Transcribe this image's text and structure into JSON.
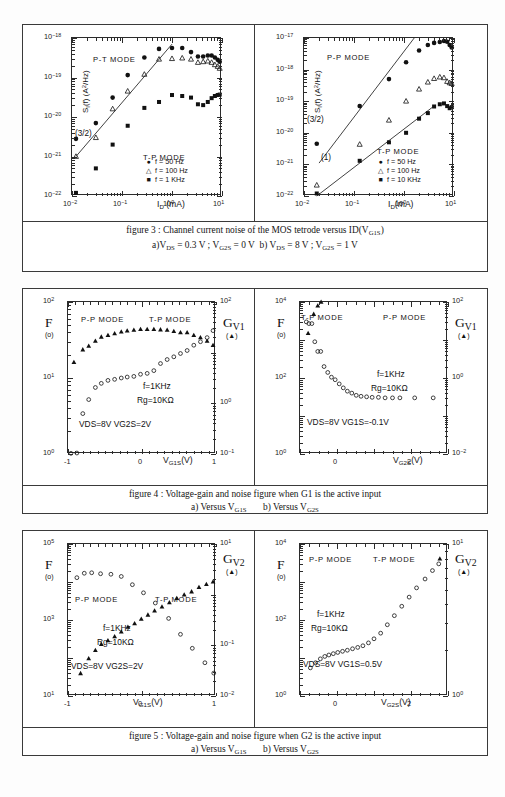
{
  "page": {
    "background": "#ffffff",
    "ink": "#1a1a1a"
  },
  "figures": [
    {
      "id": "figure-3",
      "caption_line1": "figure 3 : Channel current noise of the MOS tetrode versus ID(VG1S)",
      "caption_line2": "a)VDS = 0.3 V ; VG2S = 0 V   b) VDS = 8 V ; VG2S = 1 V",
      "caption_parts": {
        "label": "figure 3 :",
        "text": "Channel current noise of the MOS tetrode versus ID(V",
        "sub1": "G1S",
        "tail": ")",
        "a_prefix": "a)V",
        "a_sub1": "DS",
        "a_mid": " = 0.3 V ; V",
        "a_sub2": "G2S",
        "a_end": " = 0 V",
        "b_prefix": "b) V",
        "b_sub1": "DS",
        "b_mid": " = 8 V ; V",
        "b_sub2": "G2S",
        "b_end": " = 1 V"
      }
    },
    {
      "id": "figure-4",
      "caption_line1": "figure 4 : Voltage-gain and noise figure when G1 is the active input",
      "caption_line2": "a) Versus VG1S        b) Versus VG2S",
      "caption_parts": {
        "label": "figure 4 :",
        "text": "Voltage-gain and noise figure when G1 is the active input",
        "a_prefix": "a) Versus V",
        "a_sub": "G1S",
        "b_prefix": "b) Versus V",
        "b_sub": "G2S"
      }
    },
    {
      "id": "figure-5",
      "caption_line1": "figure 5 : Voltage-gain and noise figure when G2 is the active input",
      "caption_line2": "a) Versus VG1S        b) Versus VG2S",
      "caption_parts": {
        "label": "figure 5 :",
        "text": "Voltage-gain and noise figure when G2 is the active input",
        "a_prefix": "a) Versus V",
        "a_sub": "G1S",
        "b_prefix": "b) Versus V",
        "b_sub": "G2S"
      }
    }
  ],
  "chart_data": [
    {
      "id": "fig3a",
      "type": "scatter",
      "title": "",
      "xlabel": "I_D (mA)",
      "ylabel": "S_I(f)  (A^2/Hz)",
      "xscale": "log",
      "yscale": "log",
      "xlim": [
        0.01,
        10
      ],
      "ylim": [
        1e-22,
        1e-18
      ],
      "xticklabels": [
        "10-2",
        "10-1",
        "100",
        "101"
      ],
      "yticklabels": [
        "10-18",
        "10-19",
        "10-20",
        "10-21",
        "10-22"
      ],
      "mode_labels": [
        "P-T MODE",
        "T-P MODE"
      ],
      "slope_annotations": [
        "(3/2)"
      ],
      "legend_position": "lower-right",
      "series": [
        {
          "name": "f = 50 Hz",
          "marker": "filled-circle",
          "x": [
            0.012,
            0.03,
            0.065,
            0.13,
            0.28,
            0.55,
            1.0,
            1.6,
            2.4,
            3.3,
            4.2,
            5.2,
            6.2,
            7.2,
            8.2,
            9.0
          ],
          "y": [
            2.8e-21,
            7e-21,
            3.1e-20,
            1.15e-19,
            3.2e-19,
            5.3e-19,
            5.6e-19,
            5.6e-19,
            4.4e-19,
            3.4e-19,
            3.4e-19,
            3.6e-19,
            3.6e-19,
            3.2e-19,
            2.8e-19,
            2.5e-19
          ]
        },
        {
          "name": "f = 100 Hz",
          "marker": "open-triangle",
          "x": [
            0.012,
            0.03,
            0.065,
            0.13,
            0.28,
            0.55,
            1.0,
            1.6,
            2.4,
            3.3,
            4.2,
            5.2,
            6.2,
            7.2,
            8.2,
            9.0
          ],
          "y": [
            1e-21,
            3e-21,
            1.6e-20,
            4.5e-20,
            1.2e-19,
            2.9e-19,
            3e-19,
            3.1e-19,
            2.9e-19,
            2.4e-19,
            2.5e-19,
            2.6e-19,
            2.4e-19,
            2.1e-19,
            1.9e-19,
            1.7e-19
          ]
        },
        {
          "name": "f = 1 KHz",
          "marker": "filled-square",
          "x": [
            0.012,
            0.03,
            0.065,
            0.13,
            0.28,
            0.55,
            1.0,
            1.6,
            2.4,
            3.3,
            4.2,
            5.2,
            6.2,
            7.2,
            8.2,
            9.0
          ],
          "y": [
            1.2e-22,
            5e-22,
            2e-21,
            6e-21,
            1.7e-20,
            2.4e-20,
            3.6e-20,
            3.4e-20,
            3.1e-20,
            2.1e-20,
            2e-20,
            2.4e-20,
            3e-20,
            3.4e-20,
            3.6e-20,
            3.7e-20
          ]
        }
      ]
    },
    {
      "id": "fig3b",
      "type": "scatter",
      "title": "",
      "xlabel": "I_D (mA)",
      "ylabel": "S_I(f)  (A^2/Hz)",
      "xscale": "log",
      "yscale": "log",
      "xlim": [
        0.01,
        10
      ],
      "ylim": [
        1e-22,
        1e-17
      ],
      "xticklabels": [
        "10-2",
        "10-1",
        "100",
        "101"
      ],
      "yticklabels": [
        "10-17",
        "10-18",
        "10-19",
        "10-20",
        "10-21",
        "10-22"
      ],
      "mode_labels": [
        "P-P MODE",
        "T-P MODE"
      ],
      "slope_annotations": [
        "(3/2)",
        "(1)"
      ],
      "legend_position": "lower-right",
      "series": [
        {
          "name": "f = 50 Hz",
          "marker": "filled-circle",
          "x": [
            0.018,
            0.13,
            0.5,
            1.1,
            2.0,
            3.0,
            4.0,
            5.2,
            6.3,
            7.3,
            8.2,
            9.0
          ],
          "y": [
            4.5e-21,
            7e-20,
            5e-19,
            1.7e-18,
            4e-18,
            6e-18,
            7e-18,
            7.5e-18,
            8e-18,
            7.6e-18,
            6e-18,
            5e-18
          ]
        },
        {
          "name": "f = 100 Hz",
          "marker": "open-triangle",
          "x": [
            0.018,
            0.13,
            0.5,
            1.1,
            2.0,
            3.0,
            4.0,
            5.2,
            6.3,
            7.3,
            8.2,
            9.0
          ],
          "y": [
            2.2e-22,
            4.3e-21,
            2.5e-20,
            1e-19,
            2.4e-19,
            4e-19,
            5.2e-19,
            5.8e-19,
            5.5e-19,
            4.2e-19,
            3.8e-19,
            3.6e-19
          ]
        },
        {
          "name": "f = 10 KHz",
          "marker": "filled-square",
          "x": [
            0.018,
            0.13,
            0.5,
            1.1,
            2.0,
            3.0,
            4.0,
            5.2,
            6.3,
            7.3,
            8.2,
            9.0
          ],
          "y": [
            1.2e-22,
            1.3e-21,
            5e-21,
            1e-20,
            2.8e-20,
            4.2e-20,
            6.8e-20,
            8e-20,
            8.5e-20,
            7e-20,
            6e-20,
            6.5e-20
          ]
        }
      ]
    },
    {
      "id": "fig4a",
      "type": "scatter",
      "xlabel": "V_G1S (V)",
      "ylabel_left": "F",
      "ylabel_left_marker": "(o)",
      "ylabel_right": "G_V1",
      "ylabel_right_marker": "(▲)",
      "xscale": "linear",
      "yscale": "log",
      "xlim": [
        -1,
        1
      ],
      "ylim_left": [
        1,
        100
      ],
      "ylim_right": [
        0.1,
        100
      ],
      "xticklabels": [
        "-1",
        "0",
        "1"
      ],
      "yticklabels_left": [
        "102",
        "101",
        "100"
      ],
      "yticklabels_right": [
        "102",
        "100",
        "10-1"
      ],
      "mode_labels": [
        "P-P MODE",
        "T-P MODE"
      ],
      "annotations": [
        "f=1KHz",
        "Rg=10KΩ",
        "VDS=8V   VG2S=2V"
      ],
      "series": [
        {
          "name": "Gv1",
          "marker": "filled-triangle",
          "x": [
            -0.92,
            -0.8,
            -0.72,
            -0.63,
            -0.55,
            -0.46,
            -0.37,
            -0.28,
            -0.2,
            -0.11,
            -0.02,
            0.07,
            0.16,
            0.25,
            0.34,
            0.43,
            0.52,
            0.61,
            0.7,
            0.79,
            0.88,
            0.96
          ],
          "y": [
            6.5,
            11.5,
            13.5,
            17,
            20.5,
            22,
            24,
            26,
            27,
            28,
            29,
            29,
            29,
            28.5,
            28,
            26.5,
            25,
            25,
            22,
            20,
            17,
            14
          ]
        },
        {
          "name": "F",
          "marker": "open-circle",
          "x": [
            -0.96,
            -0.88,
            -0.8,
            -0.72,
            -0.63,
            -0.55,
            -0.46,
            -0.37,
            -0.28,
            -0.2,
            -0.11,
            -0.02,
            0.07,
            0.16,
            0.25,
            0.34,
            0.43,
            0.52,
            0.61,
            0.7,
            0.79,
            0.88,
            0.96
          ],
          "y": [
            1.02,
            1.03,
            3.4,
            5.2,
            7.5,
            8.5,
            9.3,
            9.6,
            10.0,
            10.3,
            10.5,
            11.2,
            11.5,
            12.5,
            15.5,
            17.5,
            19,
            21,
            23,
            27,
            30,
            34,
            42
          ]
        }
      ]
    },
    {
      "id": "fig4b",
      "type": "scatter",
      "xlabel": "V_G2S (V)",
      "ylabel_left": "F",
      "ylabel_left_marker": "(o)",
      "ylabel_right": "G_V1",
      "ylabel_right_marker": "(▲)",
      "xscale": "linear",
      "yscale": "log",
      "xlim": [
        -1,
        3
      ],
      "ylim_left": [
        1,
        10000
      ],
      "ylim_right": [
        0.01,
        100
      ],
      "xticklabels": [
        "0",
        "2"
      ],
      "yticklabels_left": [
        "104",
        "102",
        "100"
      ],
      "yticklabels_right": [
        "102",
        "100",
        "10-2"
      ],
      "mode_labels": [
        "T-P MODE",
        "P-P MODE"
      ],
      "annotations": [
        "f=1KHz",
        "Rg=10KΩ",
        "VDS=8V   VG1S=-0.1V"
      ],
      "series": [
        {
          "name": "Gv1",
          "marker": "filled-triangle",
          "x": [
            -0.78,
            -0.63,
            -0.52,
            -0.43,
            -0.35,
            -0.26,
            -0.17,
            -0.05,
            0.08,
            0.22,
            0.38,
            0.55,
            0.75,
            0.95,
            1.15,
            1.38,
            1.6,
            1.82,
            2.05,
            2.45,
            2.85
          ],
          "y": [
            15,
            48,
            80,
            100,
            125,
            165,
            210,
            300,
            440,
            620,
            830,
            1000,
            1080,
            1120,
            1150,
            1180,
            1200,
            1210,
            1220,
            1230,
            1240
          ]
        },
        {
          "name": "F",
          "marker": "open-circle",
          "x": [
            -0.83,
            -0.76,
            -0.68,
            -0.6,
            -0.52,
            -0.44,
            -0.35,
            -0.25,
            -0.15,
            -0.05,
            0.06,
            0.17,
            0.28,
            0.4,
            0.52,
            0.65,
            0.8,
            0.95,
            1.12,
            1.3,
            1.5,
            1.7,
            2.1,
            2.6
          ],
          "y": [
            3000,
            2700,
            2700,
            900,
            500,
            500,
            200,
            140,
            105,
            90,
            70,
            55,
            45,
            40,
            35,
            33,
            32,
            31,
            31,
            30,
            30,
            30,
            30,
            30
          ]
        }
      ]
    },
    {
      "id": "fig5a",
      "type": "scatter",
      "xlabel": "V_G1S (V)",
      "ylabel_left": "F",
      "ylabel_left_marker": "(o)",
      "ylabel_right": "G_V2",
      "ylabel_right_marker": "(▲)",
      "xscale": "linear",
      "yscale": "log",
      "xlim": [
        -1,
        1
      ],
      "ylim_left": [
        10,
        100000
      ],
      "ylim_right": [
        0.01,
        10
      ],
      "xticklabels": [
        "-1",
        "0",
        "1"
      ],
      "yticklabels_left": [
        "105",
        "103",
        "101"
      ],
      "yticklabels_right": [
        "101",
        "10-1",
        "10-2"
      ],
      "mode_labels": [
        "P-P MODE",
        "T-P MODE"
      ],
      "annotations": [
        "f=1KHz",
        "Rg=10KΩ",
        "VDS=8V   VG2S=2V"
      ],
      "series": [
        {
          "name": "Gv2",
          "marker": "filled-triangle",
          "x": [
            -0.83,
            -0.72,
            -0.63,
            -0.55,
            -0.46,
            -0.37,
            -0.28,
            -0.19,
            -0.1,
            -0.01,
            0.08,
            0.17,
            0.27,
            0.37,
            0.47,
            0.57,
            0.67,
            0.77,
            0.87,
            0.96
          ],
          "y": [
            0.028,
            0.055,
            0.08,
            0.105,
            0.125,
            0.15,
            0.185,
            0.23,
            0.27,
            0.33,
            0.4,
            0.48,
            0.58,
            0.7,
            0.85,
            1.0,
            1.15,
            1.4,
            1.6,
            1.8
          ]
        },
        {
          "name": "F",
          "marker": "open-circle",
          "x": [
            -0.88,
            -0.78,
            -0.68,
            -0.56,
            -0.42,
            -0.28,
            -0.13,
            0.02,
            0.18,
            0.36,
            0.52,
            0.68,
            0.85,
            0.97
          ],
          "y": [
            13000,
            17000,
            17500,
            16500,
            16000,
            14000,
            8500,
            5200,
            2800,
            1100,
            420,
            180,
            75,
            40
          ]
        }
      ]
    },
    {
      "id": "fig5b",
      "type": "scatter",
      "xlabel": "V_G2S (V)",
      "ylabel_left": "F",
      "ylabel_left_marker": "(o)",
      "ylabel_right": "G_V2",
      "ylabel_right_marker": "(▲)",
      "xscale": "linear",
      "yscale": "log",
      "xlim": [
        -1,
        3
      ],
      "ylim_left": [
        1,
        10000
      ],
      "ylim_right": [
        1,
        10
      ],
      "xticklabels": [
        "0",
        "2"
      ],
      "yticklabels_left": [
        "104",
        "102",
        "100"
      ],
      "yticklabels_right": [
        "101",
        "100"
      ],
      "mode_labels": [
        "P-P MODE",
        "T-P MODE"
      ],
      "annotations": [
        "f=1KHz",
        "Rg=10KΩ",
        "VDS=8V   VG1S=0.5V"
      ],
      "series": [
        {
          "name": "Gv2",
          "marker": "filled-triangle",
          "x": [
            -0.5,
            -0.32,
            -0.16,
            0.0,
            0.17,
            0.33,
            0.5,
            0.66,
            0.83,
            1.0,
            1.18,
            1.35,
            1.52,
            1.7,
            1.88,
            2.05,
            2.25,
            2.45,
            2.62,
            2.78
          ],
          "y": [
            1000,
            2400,
            3000,
            3600,
            4300,
            4400,
            4300,
            3400,
            2400,
            1700,
            1200,
            620,
            330,
            205,
            125,
            75,
            40,
            22,
            13,
            8
          ]
        },
        {
          "name": "F",
          "marker": "open-circle",
          "x": [
            -0.72,
            -0.58,
            -0.45,
            -0.33,
            -0.22,
            -0.1,
            0.02,
            0.15,
            0.28,
            0.42,
            0.56,
            0.7,
            0.85,
            1.0,
            1.18,
            1.36,
            1.55,
            1.75,
            1.95,
            2.15,
            2.38,
            2.58,
            2.75
          ],
          "y": [
            5.5,
            7.5,
            9.5,
            11,
            12,
            13,
            14,
            15,
            16,
            17.5,
            19,
            21,
            25,
            32,
            45,
            75,
            130,
            230,
            400,
            700,
            1200,
            2000,
            3000
          ]
        }
      ]
    }
  ]
}
